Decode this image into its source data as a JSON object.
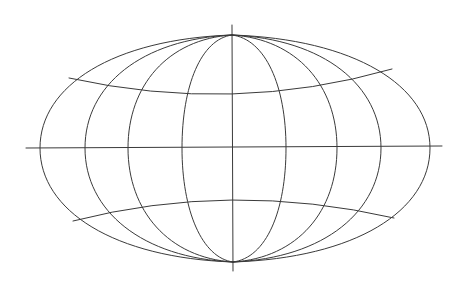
{
  "diagram": {
    "type": "map-projection-graticule",
    "stroke_color": "#3a3a3a",
    "background": "#ffffff",
    "center": {
      "x": 232,
      "y": 148
    },
    "north_pole": {
      "x": 232,
      "y": 35
    },
    "south_pole": {
      "x": 233,
      "y": 262
    },
    "central_meridian": {
      "x1": 232,
      "y1": 25,
      "x2": 233,
      "y2": 271
    },
    "equator": {
      "x1": 26,
      "y1": 148,
      "x2": 442,
      "y2": 146
    },
    "meridians_equator_x": [
      40,
      85,
      128,
      182,
      286,
      337,
      381,
      430
    ],
    "parallels": [
      {
        "name": "north-parallel",
        "start": {
          "x": 69,
          "y": 78
        },
        "mid": {
          "x": 232,
          "y": 94
        },
        "end": {
          "x": 392,
          "y": 69
        }
      },
      {
        "name": "south-parallel",
        "start": {
          "x": 73,
          "y": 221
        },
        "mid": {
          "x": 232,
          "y": 200
        },
        "end": {
          "x": 394,
          "y": 218
        }
      }
    ]
  }
}
